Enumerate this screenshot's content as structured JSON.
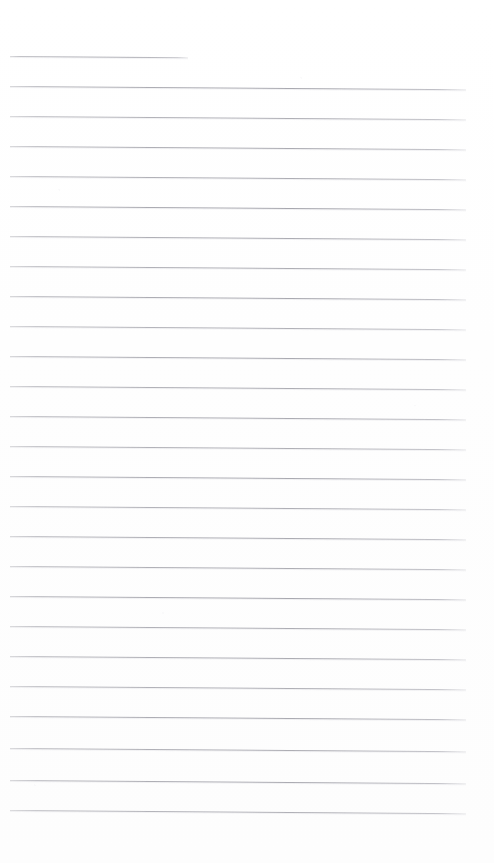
{
  "document": {
    "kind": "scanned-ruled-paper",
    "title": "Blank lined notebook page",
    "page_width": 494,
    "page_height": 863,
    "background_color": "#fefefe",
    "rule_color": "#a0a0a8",
    "has_handwriting": false,
    "has_text": false,
    "margin_left": 10,
    "margin_right": 28,
    "first_rule_y": 56,
    "rule_spacing": 30,
    "rule_count": 26,
    "rule_slant_deg": 0.42,
    "notes": "Empty scanned ruled sheet; no written content, no headers, no page numbers."
  },
  "rules": [
    {
      "index": 1,
      "y": 56,
      "x": 10,
      "width": 178,
      "opacity": 0.8,
      "truncated": true
    },
    {
      "index": 2,
      "y": 86,
      "x": 10,
      "width": 456,
      "opacity": 0.88,
      "truncated": false
    },
    {
      "index": 3,
      "y": 116,
      "x": 10,
      "width": 456,
      "opacity": 0.82,
      "truncated": false
    },
    {
      "index": 4,
      "y": 146,
      "x": 10,
      "width": 456,
      "opacity": 0.86,
      "truncated": false
    },
    {
      "index": 5,
      "y": 176,
      "x": 10,
      "width": 456,
      "opacity": 0.84,
      "truncated": false
    },
    {
      "index": 6,
      "y": 206,
      "x": 10,
      "width": 456,
      "opacity": 0.9,
      "truncated": false
    },
    {
      "index": 7,
      "y": 236,
      "x": 10,
      "width": 456,
      "opacity": 0.85,
      "truncated": false
    },
    {
      "index": 8,
      "y": 266,
      "x": 10,
      "width": 456,
      "opacity": 0.83,
      "truncated": false
    },
    {
      "index": 9,
      "y": 296,
      "x": 10,
      "width": 456,
      "opacity": 0.88,
      "truncated": false
    },
    {
      "index": 10,
      "y": 326,
      "x": 10,
      "width": 456,
      "opacity": 0.8,
      "truncated": false
    },
    {
      "index": 11,
      "y": 356,
      "x": 10,
      "width": 456,
      "opacity": 0.87,
      "truncated": false
    },
    {
      "index": 12,
      "y": 386,
      "x": 10,
      "width": 456,
      "opacity": 0.84,
      "truncated": false
    },
    {
      "index": 13,
      "y": 416,
      "x": 10,
      "width": 456,
      "opacity": 0.86,
      "truncated": false
    },
    {
      "index": 14,
      "y": 446,
      "x": 10,
      "width": 456,
      "opacity": 0.82,
      "truncated": false
    },
    {
      "index": 15,
      "y": 476,
      "x": 10,
      "width": 456,
      "opacity": 0.88,
      "truncated": false
    },
    {
      "index": 16,
      "y": 506,
      "x": 10,
      "width": 456,
      "opacity": 0.81,
      "truncated": false
    },
    {
      "index": 17,
      "y": 536,
      "x": 10,
      "width": 456,
      "opacity": 0.86,
      "truncated": false
    },
    {
      "index": 18,
      "y": 566,
      "x": 10,
      "width": 456,
      "opacity": 0.84,
      "truncated": false
    },
    {
      "index": 19,
      "y": 596,
      "x": 10,
      "width": 456,
      "opacity": 0.89,
      "truncated": false
    },
    {
      "index": 20,
      "y": 626,
      "x": 10,
      "width": 456,
      "opacity": 0.83,
      "truncated": false
    },
    {
      "index": 21,
      "y": 656,
      "x": 10,
      "width": 456,
      "opacity": 0.85,
      "truncated": false
    },
    {
      "index": 22,
      "y": 686,
      "x": 10,
      "width": 456,
      "opacity": 0.82,
      "truncated": false
    },
    {
      "index": 23,
      "y": 716,
      "x": 10,
      "width": 456,
      "opacity": 0.87,
      "truncated": false
    },
    {
      "index": 24,
      "y": 748,
      "x": 10,
      "width": 456,
      "opacity": 0.84,
      "truncated": false
    },
    {
      "index": 25,
      "y": 780,
      "x": 10,
      "width": 456,
      "opacity": 0.86,
      "truncated": false
    },
    {
      "index": 26,
      "y": 810,
      "x": 10,
      "width": 456,
      "opacity": 0.8,
      "truncated": false
    }
  ]
}
